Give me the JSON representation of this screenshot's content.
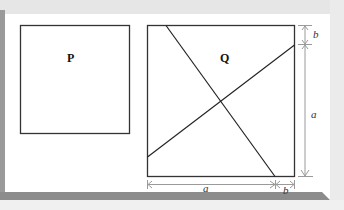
{
  "figure": {
    "square_p": {
      "label": "P"
    },
    "square_q": {
      "label": "Q"
    },
    "dimensions": {
      "right_top": "b",
      "right_main": "a",
      "bottom_main": "a",
      "bottom_right": "b"
    }
  },
  "colors": {
    "frame_dark": "#8c8c8c",
    "frame_light": "#e4e4e4",
    "line": "#222222",
    "dimension": "#9a9a9a"
  }
}
